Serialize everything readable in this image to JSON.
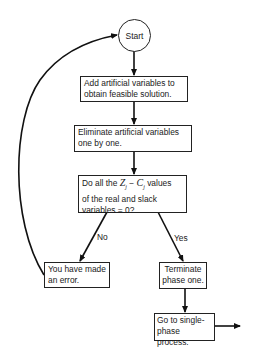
{
  "flowchart": {
    "start": {
      "label": "Start"
    },
    "nodes": [
      {
        "id": "add",
        "line1": "Add artificial variables to",
        "line2": "obtain feasible solution."
      },
      {
        "id": "eliminate",
        "line1": "Eliminate artificial variables",
        "line2": "one by one."
      },
      {
        "id": "decision",
        "prefix": "Do all the ",
        "z": "Z",
        "zsub": "j",
        "minus": " − ",
        "c": "C",
        "csub": "j",
        "suffix": " values",
        "line2": "of the real and slack",
        "line3": "variables = 0?"
      },
      {
        "id": "error",
        "line1": "You have made",
        "line2": "an error."
      },
      {
        "id": "terminate",
        "line1": "Terminate",
        "line2": "phase one."
      },
      {
        "id": "single",
        "line1": "Go to single-",
        "line2": "phase process."
      }
    ],
    "edge_labels": {
      "no": "No",
      "yes": "Yes"
    }
  }
}
